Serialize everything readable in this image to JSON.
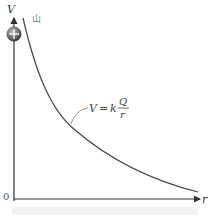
{
  "figure": {
    "y_axis_label": "V",
    "x_axis_label": "r",
    "origin_label": "0",
    "charge_symbol": "+",
    "top_mark": "山",
    "formula": {
      "lhs": "V",
      "equals": "=",
      "k": "k",
      "numerator": "Q",
      "denominator": "r"
    },
    "caption": ""
  },
  "colors": {
    "axis": "#333333",
    "curve": "#444444",
    "charge_fill": "#555555",
    "caption_bg": "#f2f2f2"
  }
}
